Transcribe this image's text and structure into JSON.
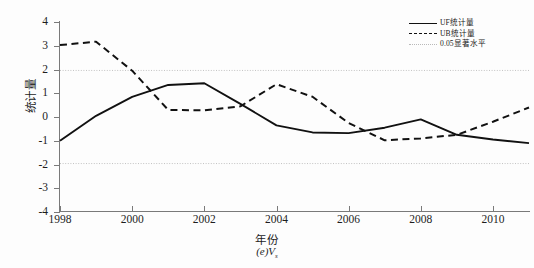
{
  "chart_data": {
    "type": "line",
    "title": "",
    "caption": "(e)V",
    "caption_sub": "s",
    "xlabel": "年份",
    "ylabel": "统计量",
    "xlim": [
      1998,
      2011
    ],
    "ylim": [
      -4,
      4
    ],
    "grid": false,
    "legend_position": "top-right",
    "xticks": [
      "1998",
      "2000",
      "2002",
      "2004",
      "2006",
      "2008",
      "2010"
    ],
    "xtick_values": [
      1998,
      2000,
      2002,
      2004,
      2006,
      2008,
      2010
    ],
    "yticks": [
      "4",
      "3",
      "2",
      "1",
      "0",
      "-1",
      "-2",
      "-3",
      "-4"
    ],
    "ytick_values": [
      4,
      3,
      2,
      1,
      0,
      -1,
      -2,
      -3,
      -4
    ],
    "x": [
      1998,
      1999,
      2000,
      2001,
      2002,
      2003,
      2004,
      2005,
      2006,
      2007,
      2008,
      2009,
      2010,
      2011
    ],
    "series": [
      {
        "name": "UF统计量",
        "style": "solid",
        "color": "#111111",
        "values": [
          -1.0,
          0.05,
          0.85,
          1.35,
          1.42,
          0.55,
          -0.35,
          -0.65,
          -0.68,
          -0.45,
          -0.1,
          -0.75,
          -0.95,
          -1.1
        ]
      },
      {
        "name": "UB统计量",
        "style": "dashed",
        "color": "#111111",
        "values": [
          3.03,
          3.17,
          1.95,
          0.3,
          0.28,
          0.45,
          1.38,
          0.85,
          -0.25,
          -0.98,
          -0.9,
          -0.75,
          -0.2,
          0.4
        ]
      }
    ],
    "reference_lines": [
      {
        "name": "0.05显著水平",
        "style": "dotted",
        "color": "#c2c2c2",
        "value": 1.96
      },
      {
        "name": "0.05显著水平",
        "style": "dotted",
        "color": "#c2c2c2",
        "value": -1.96
      }
    ],
    "legend": [
      {
        "label": "UF统计量",
        "style": "solid"
      },
      {
        "label": "UB统计量",
        "style": "dashed"
      },
      {
        "label": "0.05显著水平",
        "style": "dotted"
      }
    ]
  }
}
